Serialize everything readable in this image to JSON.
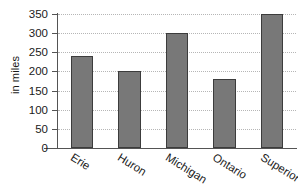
{
  "chart_data": {
    "type": "bar",
    "title": "",
    "subtitle": "",
    "xlabel": "",
    "ylabel": "in miles",
    "categories": [
      "Erie",
      "Huron",
      "Michigan",
      "Ontario",
      "Superior"
    ],
    "values": [
      240,
      200,
      300,
      180,
      350
    ],
    "series": [
      {
        "name": "length",
        "values": [
          240,
          200,
          300,
          180,
          350
        ]
      }
    ],
    "ylim": [
      0,
      350
    ],
    "ytick_labels": [
      "0",
      "50",
      "100",
      "150",
      "200",
      "250",
      "300",
      "350"
    ],
    "ytick_values": [
      0,
      50,
      100,
      150,
      200,
      250,
      300,
      350
    ],
    "grid": true,
    "grid_axis": "y",
    "grid_style": "dotted",
    "legend": false,
    "legend_position": "none",
    "bar_color": "#787878",
    "bar_edge_color": "#3c3c3c",
    "grid_color": "#b6b6b6",
    "axis_color": "#545454",
    "text_color": "#1a1a1a",
    "background_color": "#ffffff",
    "xtick_label_rotation": 32
  }
}
